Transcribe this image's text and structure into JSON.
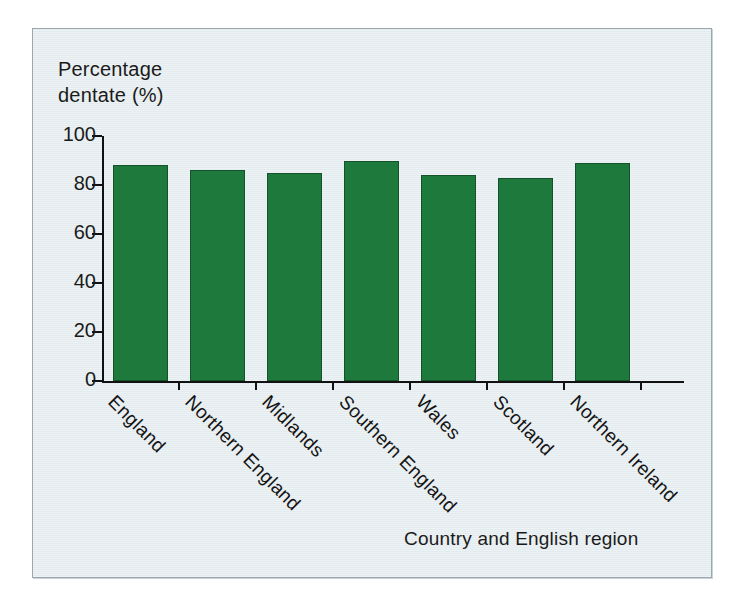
{
  "figure": {
    "background_color": "#e7eef1",
    "frame_border_color": "#9aa7ad",
    "bar_color": "#1e7a3c",
    "bar_edge_color": "#14532a",
    "axis_color": "#111111"
  },
  "chart_data": {
    "type": "bar",
    "title": "",
    "subtitle": "",
    "xlabel": "Country and English region",
    "ylabel": "Percentage dentate (%)",
    "ylabel_lines": [
      "Percentage",
      "dentate (%)"
    ],
    "categories": [
      "England",
      "Northern England",
      "Midlands",
      "Southern England",
      "Wales",
      "Scotland",
      "Northern Ireland"
    ],
    "values": [
      88,
      86,
      85,
      90,
      84,
      83,
      89
    ],
    "ylim": [
      0,
      100
    ],
    "yticks": [
      0,
      20,
      40,
      60,
      80,
      100
    ],
    "ytick_labels": [
      "0",
      "20",
      "40",
      "60",
      "80",
      "100"
    ],
    "grid": false,
    "legend": false,
    "legend_position": "none",
    "bar_orientation": "vertical",
    "xtick_label_rotation": 45,
    "series": [
      {
        "name": "Percentage dentate",
        "values": [
          88,
          86,
          85,
          90,
          84,
          83,
          89
        ]
      }
    ]
  }
}
